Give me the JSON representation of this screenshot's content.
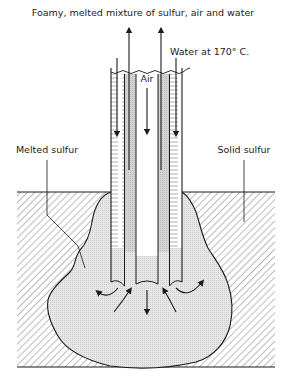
{
  "diagram": {
    "title_label": "Foamy, melted mixture of sulfur, air and water",
    "labels": {
      "water_in": "Water at 170° C.",
      "air": "Air",
      "melted_sulfur": "Melted sulfur",
      "solid_sulfur": "Solid sulfur"
    },
    "colors": {
      "line": "#1a1a1a",
      "molten_fill": "#e4e4e4",
      "hatch": "#555555",
      "background": "#ffffff"
    },
    "components": [
      "outer-water-pipe",
      "sulfur-return-annulus",
      "central-air-pipe",
      "molten-sulfur-pocket",
      "solid-sulfur-ground"
    ]
  }
}
